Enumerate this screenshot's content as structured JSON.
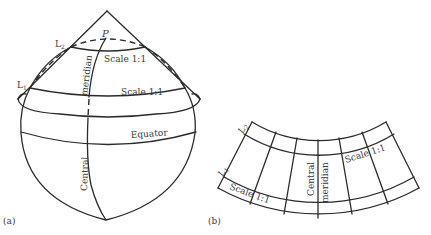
{
  "figure": {
    "panel_a": {
      "caption": "(a)",
      "apex_label": "P",
      "L2_label": "L",
      "L2_sub": "2",
      "L1_label": "L",
      "L1_sub": "1",
      "scale_upper": "Scale 1:1",
      "scale_lower": "Scale 1:1",
      "equator": "Equator",
      "meridian_word1": "Central",
      "meridian_word2": "meridian"
    },
    "panel_b": {
      "caption": "(b)",
      "L2_label": "L",
      "L2_sub": "2",
      "L1_label": "L",
      "L1_sub": "1",
      "scale_left": "Scale 1:1",
      "scale_right": "Scale 1:1",
      "meridian_word1": "Central",
      "meridian_word2": "meridian"
    },
    "colors": {
      "line": "#2b2b2b",
      "text": "#3a3a3a",
      "background": "#ffffff"
    }
  }
}
